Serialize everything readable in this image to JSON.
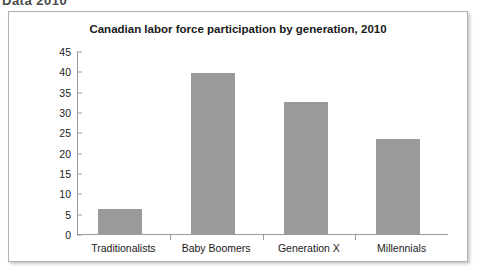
{
  "page": {
    "top_fragment_text": "Data 2010"
  },
  "chart_data": {
    "type": "bar",
    "title": "Canadian labor force participation by generation, 2010",
    "xlabel": "",
    "ylabel": "",
    "categories": [
      "Traditionalists",
      "Baby Boomers",
      "Generation X",
      "Millennials"
    ],
    "values": [
      6.5,
      39.9,
      32.8,
      23.7
    ],
    "ylim": [
      0,
      45
    ],
    "yticks": [
      0,
      5,
      10,
      15,
      20,
      25,
      30,
      35,
      40,
      45
    ],
    "ytick_labels": [
      "0",
      "5",
      "10",
      "15",
      "20",
      "25",
      "30",
      "35",
      "40",
      "45"
    ],
    "grid": false,
    "legend": null,
    "bar_color": "#9a9a9a",
    "axis_color": "#9a9a9a",
    "background": "#ffffff"
  }
}
